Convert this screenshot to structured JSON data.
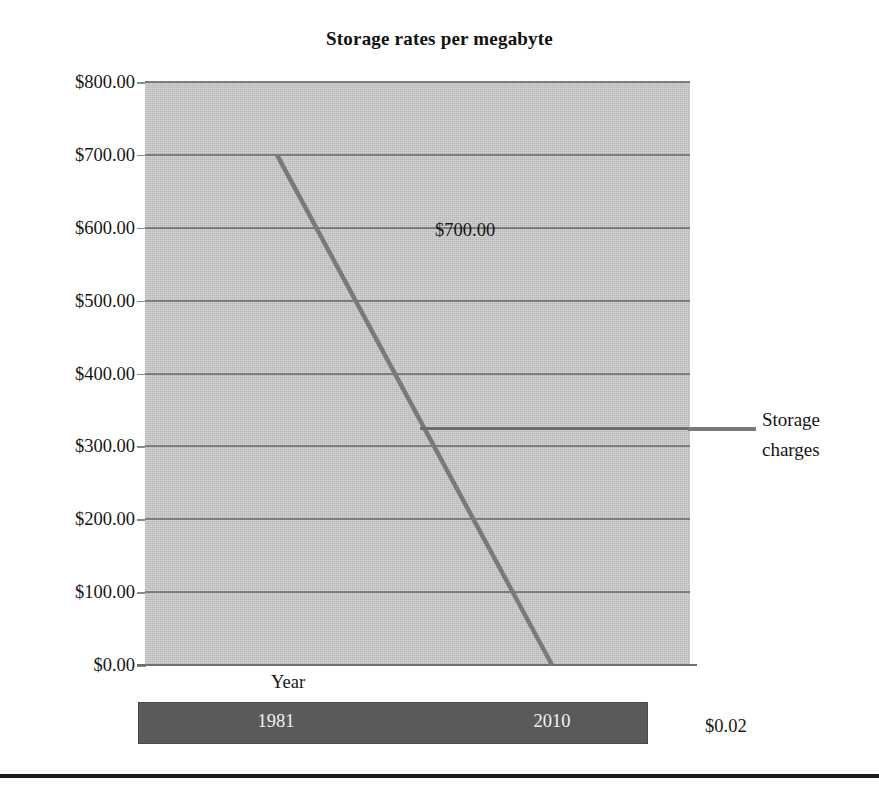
{
  "chart_data": {
    "type": "line",
    "title": "Storage rates per megabyte",
    "xlabel": "Year",
    "ylabel": "",
    "categories": [
      "1981",
      "2010"
    ],
    "x": [
      1981,
      2010
    ],
    "series": [
      {
        "name": "Storage charges",
        "values": [
          700.0,
          0.02
        ],
        "point_labels": [
          "$700.00",
          "$0.02"
        ],
        "color": "#7a7a7a"
      }
    ],
    "ylim": [
      0,
      800
    ],
    "ytick_values": [
      800,
      700,
      600,
      500,
      400,
      300,
      200,
      100,
      0
    ],
    "ytick_labels": [
      "$800.00",
      "$700.00",
      "$600.00",
      "$500.00",
      "$400.00",
      "$300.00",
      "$200.00",
      "$100.00",
      "$0.00"
    ],
    "grid": true,
    "legend_position": "right",
    "legend_entries": [
      "Storage charges"
    ],
    "plot_background": "#c4c4c4",
    "gridline_color": "#7d7d7d",
    "axis_band_color": "#5a5a5a"
  },
  "title": {
    "text": "Storage rates per megabyte"
  },
  "legend": {
    "label_line_1": "Storage",
    "label_line_2": "charges",
    "swatch_color": "#7a7a7a"
  },
  "axes": {
    "x_title": "Year",
    "x_labels": [
      "1981",
      "2010"
    ],
    "y_labels": [
      "$800.00",
      "$700.00",
      "$600.00",
      "$500.00",
      "$400.00",
      "$300.00",
      "$200.00",
      "$100.00",
      "$0.00"
    ]
  },
  "data_labels": {
    "start": "$700.00",
    "end": "$0.02"
  }
}
